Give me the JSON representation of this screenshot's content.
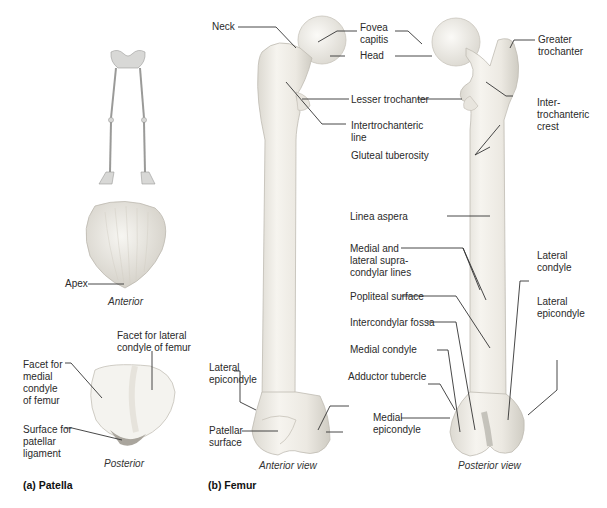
{
  "figure": {
    "panel_a": {
      "caption": "(a) Patella",
      "anterior_view_label": "Anterior",
      "posterior_view_label": "Posterior",
      "labels": {
        "apex": "Apex",
        "facet_lateral": "Facet for lateral\ncondyle of femur",
        "facet_medial": "Facet for\nmedial\ncondyle\nof femur",
        "surface_ligament": "Surface for\npatellar\nligament"
      }
    },
    "panel_b": {
      "caption": "(b) Femur",
      "anterior_view_label": "Anterior view",
      "posterior_view_label": "Posterior view",
      "labels": {
        "neck": "Neck",
        "fovea_capitis": "Fovea\ncapitis",
        "head": "Head",
        "greater_trochanter": "Greater\ntrochanter",
        "lesser_trochanter": "Lesser trochanter",
        "intertrochanteric_line": "Intertrochanteric\nline",
        "intertrochanteric_crest": "Inter-\ntrochanteric\ncrest",
        "gluteal_tuberosity": "Gluteal tuberosity",
        "linea_aspera": "Linea aspera",
        "supracondylar_lines": "Medial and\nlateral supra-\ncondylar lines",
        "lateral_condyle": "Lateral\ncondyle",
        "popliteal_surface": "Popliteal surface",
        "lateral_epicondyle_post": "Lateral\nepicondyle",
        "intercondylar_fossa": "Intercondylar fossa",
        "medial_condyle": "Medial condyle",
        "lateral_epicondyle_ant": "Lateral\nepicondyle",
        "adductor_tubercle": "Adductor tubercle",
        "medial_epicondyle": "Medial\nepicondyle",
        "patellar_surface": "Patellar\nsurface"
      }
    },
    "colors": {
      "bone_fill": "#f1efe9",
      "bone_shade": "#d8d5cc",
      "leader_line": "#333333"
    }
  }
}
